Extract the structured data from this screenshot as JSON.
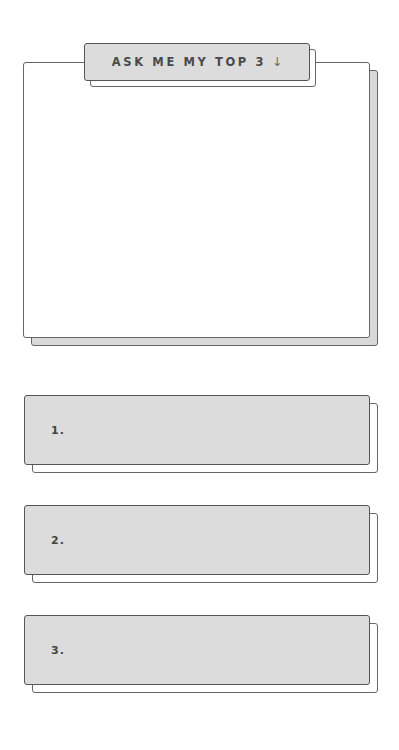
{
  "header": {
    "label": "ASK ME MY TOP 3",
    "arrow_icon": "↓"
  },
  "answer_box": {
    "content": ""
  },
  "top_list": {
    "items": [
      {
        "number": "1.",
        "value": ""
      },
      {
        "number": "2.",
        "value": ""
      },
      {
        "number": "3.",
        "value": ""
      }
    ]
  },
  "colors": {
    "fill": "#dcdcdc",
    "border": "#555555",
    "background": "#ffffff",
    "text": "#4a4a4a"
  }
}
